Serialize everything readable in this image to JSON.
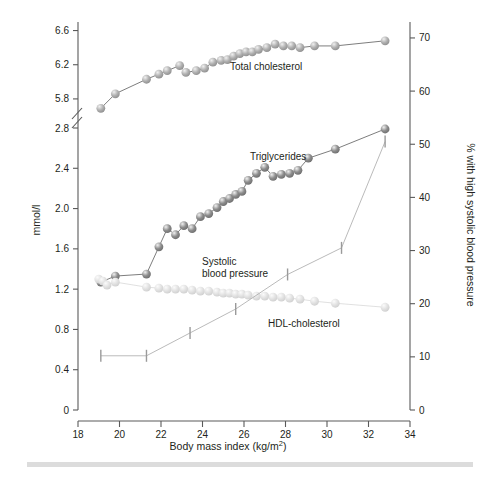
{
  "axes": {
    "left": {
      "title": "mmol/l",
      "ticks": [
        "0",
        "0.4",
        "0.8",
        "1.2",
        "1.6",
        "2.0",
        "2.4",
        "2.8",
        "5.8",
        "6.2",
        "6.6"
      ],
      "has_break": true
    },
    "right": {
      "title": "% with high systolic blood pressure",
      "ticks": [
        "0",
        "10",
        "20",
        "30",
        "40",
        "50",
        "60",
        "70"
      ]
    },
    "bottom": {
      "title": "Body mass index (kg/m",
      "title_sup": "2",
      "title_tail": ")",
      "title_full": "Body mass index (kg/m2)",
      "ticks": [
        "18",
        "20",
        "22",
        "24",
        "26",
        "28",
        "30",
        "32",
        "34"
      ]
    }
  },
  "series_labels": {
    "total_cholesterol": "Total cholesterol",
    "triglycerides": "Triglycerides",
    "systolic_line1": "Systolic",
    "systolic_line2": "blood pressure",
    "hdl": "HDL-cholesterol"
  },
  "colors": {
    "total_cholesterol": "#b0b0b0",
    "triglycerides": "#8d8d8d",
    "hdl": "#e2e2e2",
    "systolic": "#b5b5b5",
    "axis": "#5a5a5a",
    "text": "#231f20",
    "footer_bar": "#dcdcdc"
  },
  "chart_data": {
    "type": "line",
    "title": "",
    "xlabel": "Body mass index (kg/m2)",
    "ylabel": "mmol/l",
    "ylabel_right": "% with high systolic blood pressure",
    "xlim": [
      18,
      34
    ],
    "ylim_left_lower": [
      0,
      2.8
    ],
    "ylim_left_upper": [
      5.6,
      6.7
    ],
    "ylim_right": [
      0,
      73
    ],
    "axis_break_left": [
      2.8,
      5.6
    ],
    "grid": false,
    "legend": "inline-annotations",
    "series": [
      {
        "name": "Total cholesterol",
        "axis": "left",
        "unit": "mmol/l",
        "marker": "circle",
        "color": "#b0b0b0",
        "x": [
          19.1,
          19.8,
          21.3,
          21.9,
          22.3,
          22.9,
          23.2,
          23.7,
          24.1,
          24.5,
          24.9,
          25.2,
          25.5,
          25.8,
          26.1,
          26.4,
          26.7,
          27.1,
          27.5,
          27.9,
          28.3,
          28.7,
          29.4,
          30.4,
          32.8
        ],
        "y": [
          5.69,
          5.86,
          6.03,
          6.09,
          6.13,
          6.19,
          6.11,
          6.13,
          6.16,
          6.23,
          6.25,
          6.26,
          6.3,
          6.33,
          6.35,
          6.35,
          6.38,
          6.4,
          6.44,
          6.42,
          6.42,
          6.4,
          6.42,
          6.42,
          6.48
        ]
      },
      {
        "name": "Triglycerides",
        "axis": "left",
        "unit": "mmol/l",
        "marker": "circle",
        "color": "#8d8d8d",
        "x": [
          19.1,
          19.8,
          21.3,
          21.9,
          22.3,
          22.7,
          23.1,
          23.5,
          23.9,
          24.3,
          24.7,
          25.0,
          25.3,
          25.6,
          25.9,
          26.2,
          26.6,
          27.0,
          27.4,
          27.8,
          28.2,
          28.6,
          29.1,
          30.4,
          32.8
        ],
        "y": [
          1.27,
          1.33,
          1.35,
          1.62,
          1.8,
          1.74,
          1.83,
          1.8,
          1.92,
          1.95,
          2.01,
          2.07,
          2.1,
          2.14,
          2.17,
          2.28,
          2.35,
          2.41,
          2.32,
          2.34,
          2.35,
          2.38,
          2.5,
          2.59,
          2.79
        ]
      },
      {
        "name": "HDL-cholesterol",
        "axis": "left",
        "unit": "mmol/l",
        "marker": "circle",
        "color": "#e2e2e2",
        "x": [
          19.0,
          19.2,
          19.4,
          19.8,
          21.3,
          21.9,
          22.3,
          22.7,
          23.1,
          23.5,
          23.9,
          24.3,
          24.7,
          25.0,
          25.3,
          25.6,
          25.9,
          26.2,
          26.6,
          27.0,
          27.4,
          27.8,
          28.2,
          28.7,
          29.4,
          30.4,
          32.8
        ],
        "y": [
          1.3,
          1.28,
          1.24,
          1.27,
          1.22,
          1.21,
          1.2,
          1.2,
          1.2,
          1.19,
          1.18,
          1.18,
          1.17,
          1.16,
          1.16,
          1.15,
          1.15,
          1.14,
          1.13,
          1.13,
          1.12,
          1.12,
          1.11,
          1.1,
          1.08,
          1.06,
          1.02
        ]
      },
      {
        "name": "Systolic blood pressure",
        "axis": "right",
        "unit": "%",
        "marker": "vertical-tick",
        "color": "#b5b5b5",
        "x": [
          19.1,
          21.3,
          23.4,
          25.6,
          28.1,
          30.7,
          32.8
        ],
        "y": [
          10.2,
          10.2,
          14.5,
          19.0,
          25.5,
          30.5,
          50.5
        ]
      }
    ]
  }
}
